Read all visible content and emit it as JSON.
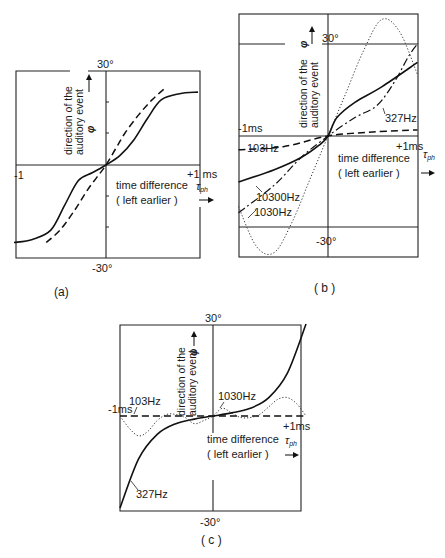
{
  "chart_data": [
    {
      "panel": "a",
      "type": "line",
      "caption": "(a)",
      "title": "",
      "xlabel": "time difference τph (left earlier)",
      "ylabel": "direction of the auditory event φ",
      "x_tick_labels": {
        "left": "-1",
        "right": "+1 ms"
      },
      "y_tick_labels": {
        "top": "30°",
        "bottom": "-30°"
      },
      "xlim": [
        -1,
        1
      ],
      "ylim": [
        -30,
        30
      ],
      "grid": false,
      "series": [
        {
          "name": "solid curve",
          "style": "solid",
          "x": [
            -1,
            -0.8,
            -0.6,
            -0.45,
            -0.3,
            -0.15,
            0,
            0.15,
            0.3,
            0.45,
            0.6,
            0.8,
            1
          ],
          "y": [
            -25,
            -24,
            -21,
            -13,
            -5,
            -2.5,
            0,
            3,
            8,
            15,
            21,
            23,
            23.5
          ]
        },
        {
          "name": "dashed curve",
          "style": "dashed",
          "x": [
            -0.65,
            -0.5,
            -0.35,
            -0.2,
            -0.1,
            0,
            0.1,
            0.2,
            0.35,
            0.5,
            0.65
          ],
          "y": [
            -25,
            -21,
            -15,
            -8,
            -4,
            0,
            5,
            10,
            16,
            21,
            25
          ]
        }
      ]
    },
    {
      "panel": "b",
      "type": "line",
      "caption": "(b)",
      "title": "",
      "xlabel": "time difference τph (left earlier)",
      "ylabel": "direction of the auditory event φ",
      "x_tick_labels": {
        "left": "-1ms",
        "right": "+1ms"
      },
      "y_tick_labels": {
        "top": "30°",
        "bottom": "-30°"
      },
      "xlim": [
        -1,
        1
      ],
      "ylim": [
        -30,
        30
      ],
      "grid": false,
      "series": [
        {
          "name": "103Hz",
          "style": "dashed",
          "x": [
            -1,
            -0.5,
            0,
            0.5,
            1
          ],
          "y": [
            -4.5,
            -3.5,
            0,
            1.3,
            2
          ]
        },
        {
          "name": "327Hz",
          "style": "dashdot",
          "x": [
            -1,
            -0.6,
            -0.3,
            0,
            0.3,
            0.55,
            0.75,
            0.9,
            1
          ],
          "y": [
            -25,
            -16,
            -7,
            0,
            6,
            10,
            18,
            26,
            30
          ]
        },
        {
          "name": "1030Hz",
          "style": "dotted",
          "x": [
            -1,
            -0.8,
            -0.6,
            -0.4,
            -0.2,
            0,
            0.2,
            0.4,
            0.6,
            0.8,
            1
          ],
          "y": [
            -23,
            -36,
            -38,
            -28,
            -14,
            0,
            14,
            28,
            38,
            34,
            20
          ]
        },
        {
          "name": "10300Hz",
          "style": "solid",
          "x": [
            -1,
            -0.6,
            -0.3,
            -0.1,
            0,
            0.1,
            0.3,
            0.6,
            1
          ],
          "y": [
            -15,
            -11,
            -7,
            -3,
            0,
            6,
            11,
            16,
            24
          ]
        }
      ]
    },
    {
      "panel": "c",
      "type": "line",
      "caption": "(c)",
      "title": "",
      "xlabel": "time difference τph (left earlier)",
      "ylabel": "direction of the auditory event φ",
      "x_tick_labels": {
        "left": "-1ms",
        "right": "+1ms"
      },
      "y_tick_labels": {
        "top": "30°",
        "bottom": "-30°"
      },
      "xlim": [
        -1,
        1
      ],
      "ylim": [
        -30,
        30
      ],
      "grid": false,
      "series": [
        {
          "name": "103Hz",
          "style": "dashed",
          "x": [
            -1,
            0,
            1
          ],
          "y": [
            0,
            0,
            0
          ]
        },
        {
          "name": "327Hz",
          "style": "solid",
          "x": [
            -1,
            -0.8,
            -0.6,
            -0.4,
            -0.2,
            0,
            0.2,
            0.4,
            0.6,
            0.8,
            1
          ],
          "y": [
            -30,
            -14,
            -6,
            -2.5,
            -1,
            0,
            1,
            2.5,
            6,
            14,
            30
          ]
        },
        {
          "name": "1030Hz",
          "style": "dotted",
          "x": [
            -1,
            -0.9,
            -0.8,
            -0.7,
            -0.6,
            -0.5,
            -0.4,
            -0.3,
            -0.2,
            -0.1,
            0,
            0.1,
            0.2,
            0.3,
            0.4,
            0.5,
            0.6,
            0.7,
            0.8,
            0.9,
            1
          ],
          "y": [
            0,
            -4,
            -6.5,
            -5,
            -1.5,
            0.5,
            0.5,
            -0.5,
            -2.5,
            -1.5,
            0,
            2.5,
            1,
            -0.5,
            -0.5,
            0.5,
            3,
            5.5,
            6,
            4,
            0
          ]
        }
      ]
    }
  ],
  "panels": {
    "a": {
      "caption": "(a)",
      "y_top": "30°",
      "y_bottom": "-30°",
      "x_left": "-1",
      "x_right": "+1 ms",
      "ylabel_line1": "direction of the",
      "ylabel_line2": "auditory event",
      "ylabel_symbol": "φ",
      "xlabel_line1": "time difference",
      "xlabel_line2": "( left earlier )",
      "xlabel_symbol": "τ",
      "xlabel_sub": "ph",
      "arrow": "→",
      "arrow_up": "↑"
    },
    "b": {
      "caption": "( b )",
      "y_top": "30°",
      "y_bottom": "-30°",
      "x_left": "-1ms",
      "x_right": "+1ms",
      "ylabel_line1": "direction of the",
      "ylabel_line2": "auditory event",
      "ylabel_symbol": "φ",
      "xlabel_line1": "time difference",
      "xlabel_line2": "( left earlier )",
      "xlabel_symbol": "τ",
      "xlabel_sub": "ph",
      "arrow": "→",
      "arrow_up": "↑",
      "labels": {
        "f103": "103Hz",
        "f327": "327Hz",
        "f1030": "1030Hz",
        "f10300": "10300Hz"
      }
    },
    "c": {
      "caption": "( c )",
      "y_top": "30°",
      "y_bottom": "-30°",
      "x_left": "-1ms",
      "x_right": "+1ms",
      "ylabel_line1": "direction of the",
      "ylabel_line2": "auditory event",
      "ylabel_symbol": "φ",
      "xlabel_line1": "time difference",
      "xlabel_line2": "( left earlier )",
      "xlabel_symbol": "τ",
      "xlabel_sub": "ph",
      "arrow": "→",
      "arrow_up": "↑",
      "labels": {
        "f103": "103Hz",
        "f327": "327Hz",
        "f1030": "1030Hz"
      }
    }
  }
}
